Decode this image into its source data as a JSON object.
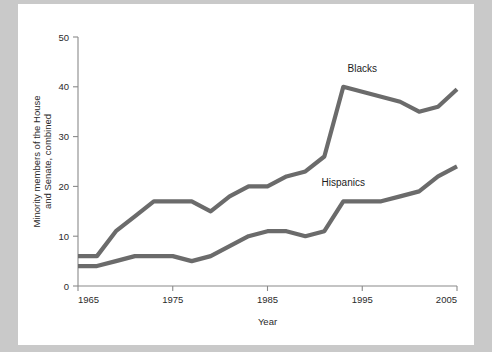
{
  "card": {
    "background_color": "#ffffff",
    "page_background_color": "#c9c9c9"
  },
  "chart_data": {
    "type": "line",
    "title": "",
    "xlabel": "Year",
    "ylabel": "Minority members of the House and Senate, combined",
    "xlim": [
      1965,
      2005
    ],
    "ylim": [
      0,
      50
    ],
    "xticks": [
      1965,
      1975,
      1985,
      1995,
      2005
    ],
    "yticks": [
      0,
      10,
      20,
      30,
      40,
      50
    ],
    "xtick_labels": [
      "1965",
      "1975",
      "1985",
      "1995",
      "2005"
    ],
    "ytick_labels": [
      "0",
      "10",
      "20",
      "30",
      "40",
      "50"
    ],
    "grid": false,
    "legend_position": "inline-labels",
    "line_color": "#6b6b6b",
    "series": [
      {
        "name": "Blacks",
        "label_x": 1995,
        "label_y": 43,
        "x": [
          1965,
          1967,
          1969,
          1971,
          1973,
          1975,
          1977,
          1979,
          1981,
          1983,
          1985,
          1987,
          1989,
          1991,
          1993,
          1995,
          1997,
          1999,
          2001,
          2003,
          2005
        ],
        "values": [
          6,
          6,
          11,
          14,
          17,
          17,
          17,
          15,
          18,
          20,
          20,
          22,
          23,
          26,
          40,
          39,
          38,
          37,
          35,
          36,
          39.5
        ]
      },
      {
        "name": "Hispanics",
        "label_x": 1993,
        "label_y": 20,
        "x": [
          1965,
          1967,
          1969,
          1971,
          1973,
          1975,
          1977,
          1979,
          1981,
          1983,
          1985,
          1987,
          1989,
          1991,
          1993,
          1995,
          1997,
          1999,
          2001,
          2003,
          2005
        ],
        "values": [
          4,
          4,
          5,
          6,
          6,
          6,
          5,
          6,
          8,
          10,
          11,
          11,
          10,
          11,
          17,
          17,
          17,
          18,
          19,
          22,
          24
        ]
      }
    ]
  }
}
